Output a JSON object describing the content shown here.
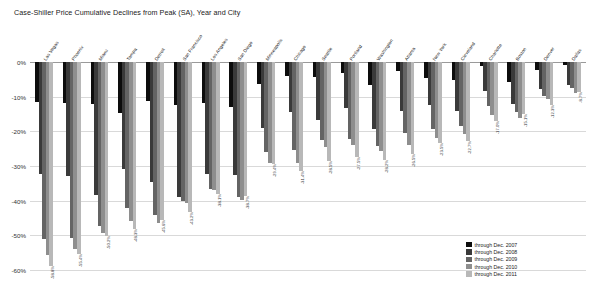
{
  "chart": {
    "title": "Case-Shiller Price Cumulative Declines from Peak (SA), Year and City",
    "legend_position": "bottom-right",
    "grid": true
  },
  "axis": {
    "y_ticks": [
      "0%",
      "-10%",
      "-20%",
      "-30%",
      "-40%",
      "-50%",
      "-60%"
    ],
    "y_min": -60,
    "y_max": 0
  },
  "legend": {
    "items": [
      {
        "label": "through Dec. 2007",
        "color": "#0d0d0d"
      },
      {
        "label": "through Dec. 2008",
        "color": "#3a3a3a"
      },
      {
        "label": "through Dec. 2009",
        "color": "#646464"
      },
      {
        "label": "through Dec. 2010",
        "color": "#8e8e8e"
      },
      {
        "label": "through Dec. 2011",
        "color": "#b8b8b8"
      }
    ]
  },
  "chart_data": {
    "type": "bar",
    "title": "Case-Shiller Price Cumulative Declines from Peak (SA), Year and City",
    "xlabel": "",
    "ylabel": "",
    "ylim": [
      -60,
      0
    ],
    "grid": true,
    "legend_position": "bottom-right",
    "categories": [
      "Las Vegas",
      "Phoenix",
      "Miami",
      "Tampa",
      "Detroit",
      "San Francisco",
      "Los Angeles",
      "San Diego",
      "Minneapolis",
      "Chicago",
      "Seattle",
      "Portland",
      "Washington",
      "Atlanta",
      "New York",
      "Cleveland",
      "Charlotte",
      "Boston",
      "Denver",
      "Dallas"
    ],
    "series": [
      {
        "name": "through Dec. 2007",
        "values": [
          -11.4,
          -11.8,
          -12.1,
          -14.7,
          -11.2,
          -12.5,
          -11.9,
          -13.0,
          -6.3,
          -3.9,
          -4.2,
          -3.1,
          -6.6,
          -2.6,
          -4.5,
          -5.3,
          -1.2,
          -5.7,
          -2.3,
          -1.0
        ]
      },
      {
        "name": "through Dec. 2008",
        "values": [
          -32.3,
          -32.8,
          -38.4,
          -30.9,
          -34.6,
          -39.0,
          -32.2,
          -32.5,
          -19.1,
          -14.4,
          -16.8,
          -13.3,
          -19.4,
          -14.2,
          -12.5,
          -14.1,
          -8.4,
          -12.1,
          -7.7,
          -6.5
        ]
      },
      {
        "name": "through Dec. 2009",
        "values": [
          -51.2,
          -50.9,
          -47.4,
          -42.0,
          -44.2,
          -40.0,
          -36.5,
          -38.9,
          -26.0,
          -25.5,
          -22.5,
          -22.3,
          -24.2,
          -20.5,
          -19.3,
          -18.6,
          -12.6,
          -14.5,
          -9.8,
          -7.6
        ]
      },
      {
        "name": "through Dec. 2010",
        "values": [
          -55.8,
          -53.9,
          -49.4,
          -45.9,
          -46.5,
          -40.6,
          -36.9,
          -39.7,
          -29.2,
          -29.0,
          -24.4,
          -24.0,
          -25.6,
          -24.0,
          -22.0,
          -20.8,
          -15.3,
          -16.1,
          -10.8,
          -8.8
        ]
      },
      {
        "name": "through Dec. 2011",
        "values": [
          -58.8,
          -55.4,
          -50.2,
          -48.3,
          -45.6,
          -43.2,
          -38.1,
          -38.7,
          -29.4,
          -31.4,
          -28.5,
          -27.5,
          -28.2,
          -26.5,
          -23.5,
          -22.7,
          -17.0,
          -15.1,
          -12.3,
          -8.7
        ]
      }
    ],
    "value_labels_2011": [
      "-58.8%",
      "-55.4%",
      "-50.2%",
      "-48.3%",
      "-45.6%",
      "-43.2%",
      "-38.1%",
      "-38.7%",
      "-29.4%",
      "-31.4%",
      "-28.5%",
      "-27.5%",
      "-28.2%",
      "-26.5%",
      "-23.5%",
      "-22.7%",
      "-17.0%",
      "-15.1%",
      "-12.3%",
      "-8.7%"
    ]
  }
}
